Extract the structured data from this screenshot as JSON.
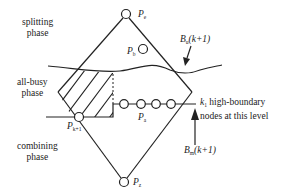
{
  "diagram": {
    "phases": {
      "splitting": [
        "splitting",
        "phase"
      ],
      "all_busy": [
        "all-busy",
        "phase"
      ],
      "combining": [
        "combining",
        "phase"
      ]
    },
    "nodes": {
      "top": {
        "name": "P",
        "sub": "e"
      },
      "b": {
        "name": "P",
        "sub": "b"
      },
      "left": {
        "name": "P",
        "sub": "k+1"
      },
      "a": {
        "name": "P",
        "sub": "a"
      },
      "bottom": {
        "name": "P",
        "sub": "z"
      }
    },
    "boundaries": {
      "upper": {
        "name": "B",
        "sub": "u",
        "arg": "(k+1)"
      },
      "lower": {
        "name": "B",
        "sub": "m",
        "arg": "(k+1)"
      }
    },
    "annotation": {
      "k_name": "k",
      "k_sub": "1",
      "line1": " high-boundary",
      "line2": "nodes at this level"
    },
    "colors": {
      "stroke": "#222222",
      "background": "#ffffff"
    }
  }
}
